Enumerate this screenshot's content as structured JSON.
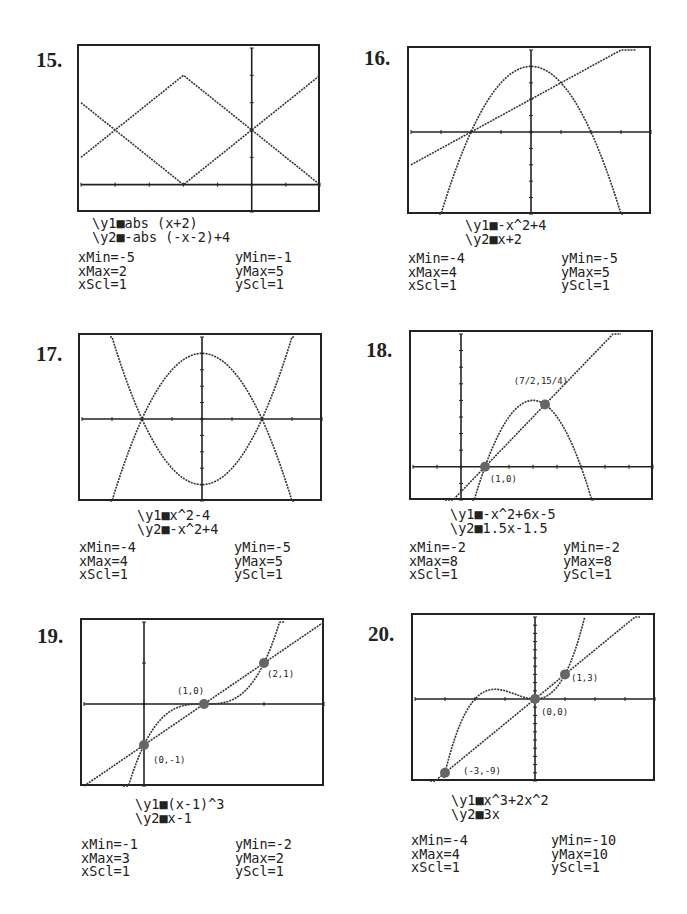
{
  "panels": [
    {
      "number": "15.",
      "eq1": "\\y1■abs (x+2)",
      "eq2": "\\y2■-abs (-x-2)+4",
      "xmin": "xMin=-5",
      "xmax": "xMax=2",
      "xscl": "xScl=1",
      "ymin": "yMin=-1",
      "ymax": "yMax=5",
      "yscl": "yScl=1"
    },
    {
      "number": "16.",
      "eq1": "\\y1■-x^2+4",
      "eq2": "\\y2■x+2",
      "xmin": "xMin=-4",
      "xmax": "xMax=4",
      "xscl": "xScl=1",
      "ymin": "yMin=-5",
      "ymax": "yMax=5",
      "yscl": "yScl=1"
    },
    {
      "number": "17.",
      "eq1": "\\y1■x^2-4",
      "eq2": "\\y2■-x^2+4",
      "xmin": "xMin=-4",
      "xmax": "xMax=4",
      "xscl": "xScl=1",
      "ymin": "yMin=-5",
      "ymax": "yMax=5",
      "yscl": "yScl=1"
    },
    {
      "number": "18.",
      "eq1": "\\y1■-x^2+6x-5",
      "eq2": "\\y2■1.5x-1.5",
      "xmin": "xMin=-2",
      "xmax": "xMax=8",
      "xscl": "xScl=1",
      "ymin": "yMin=-2",
      "ymax": "yMax=8",
      "yscl": "yScl=1",
      "labels": [
        "(7/2,15/4)",
        "(1,0)"
      ]
    },
    {
      "number": "19.",
      "eq1": "\\y1■(x-1)^3",
      "eq2": "\\y2■x-1",
      "xmin": "xMin=-1",
      "xmax": "xMax=3",
      "xscl": "xScl=1",
      "ymin": "yMin=-2",
      "ymax": "yMax=2",
      "yscl": "yScl=1",
      "labels": [
        "(1,0)",
        "(2,1)",
        "(0,-1)"
      ]
    },
    {
      "number": "20.",
      "eq1": "\\y1■x^3+2x^2",
      "eq2": "\\y2■3x",
      "xmin": "xMin=-4",
      "xmax": "xMax=4",
      "xscl": "xScl=1",
      "ymin": "yMin=-10",
      "ymax": "yMax=10",
      "yscl": "yScl=1",
      "labels": [
        "(1,3)",
        "(0,0)",
        "(-3,-9)"
      ]
    }
  ],
  "chart_data": [
    {
      "type": "line",
      "title": "15.",
      "series": [
        {
          "name": "y1",
          "expr": "abs(x+2)"
        },
        {
          "name": "y2",
          "expr": "-abs(-x-2)+4"
        }
      ],
      "xlim": [
        -5,
        2
      ],
      "ylim": [
        -1,
        5
      ],
      "xscl": 1,
      "yscl": 1,
      "intersections": [
        [
          -4,
          2
        ],
        [
          0,
          2
        ]
      ]
    },
    {
      "type": "line",
      "title": "16.",
      "series": [
        {
          "name": "y1",
          "expr": "-x^2+4"
        },
        {
          "name": "y2",
          "expr": "x+2"
        }
      ],
      "xlim": [
        -4,
        4
      ],
      "ylim": [
        -5,
        5
      ],
      "xscl": 1,
      "yscl": 1,
      "intersections": [
        [
          -2,
          0
        ],
        [
          1,
          3
        ]
      ]
    },
    {
      "type": "line",
      "title": "17.",
      "series": [
        {
          "name": "y1",
          "expr": "x^2-4"
        },
        {
          "name": "y2",
          "expr": "-x^2+4"
        }
      ],
      "xlim": [
        -4,
        4
      ],
      "ylim": [
        -5,
        5
      ],
      "xscl": 1,
      "yscl": 1,
      "intersections": [
        [
          -2,
          0
        ],
        [
          2,
          0
        ]
      ]
    },
    {
      "type": "line",
      "title": "18.",
      "series": [
        {
          "name": "y1",
          "expr": "-x^2+6x-5"
        },
        {
          "name": "y2",
          "expr": "1.5x-1.5"
        }
      ],
      "xlim": [
        -2,
        8
      ],
      "ylim": [
        -2,
        8
      ],
      "xscl": 1,
      "yscl": 1,
      "intersections": [
        [
          1,
          0
        ],
        [
          3.5,
          3.75
        ]
      ],
      "annotations": [
        "(7/2,15/4)",
        "(1,0)"
      ]
    },
    {
      "type": "line",
      "title": "19.",
      "series": [
        {
          "name": "y1",
          "expr": "(x-1)^3"
        },
        {
          "name": "y2",
          "expr": "x-1"
        }
      ],
      "xlim": [
        -1,
        3
      ],
      "ylim": [
        -2,
        2
      ],
      "xscl": 1,
      "yscl": 1,
      "intersections": [
        [
          0,
          -1
        ],
        [
          1,
          0
        ],
        [
          2,
          1
        ]
      ],
      "annotations": [
        "(0,-1)",
        "(1,0)",
        "(2,1)"
      ]
    },
    {
      "type": "line",
      "title": "20.",
      "series": [
        {
          "name": "y1",
          "expr": "x^3+2x^2"
        },
        {
          "name": "y2",
          "expr": "3x"
        }
      ],
      "xlim": [
        -4,
        4
      ],
      "ylim": [
        -10,
        10
      ],
      "xscl": 1,
      "yscl": 1,
      "intersections": [
        [
          -3,
          -9
        ],
        [
          0,
          0
        ],
        [
          1,
          3
        ]
      ],
      "annotations": [
        "(-3,-9)",
        "(0,0)",
        "(1,3)"
      ]
    }
  ]
}
